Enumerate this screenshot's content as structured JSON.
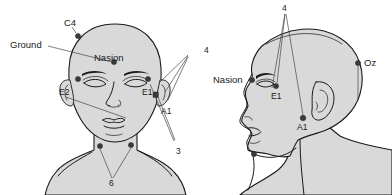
{
  "figure": {
    "views": [
      {
        "name": "frontal-view",
        "label": ""
      },
      {
        "name": "lateral-view",
        "label": ""
      }
    ],
    "colors": {
      "skin_fill": "#d9d9d9",
      "outline": "#1a1a1a",
      "electrode": "#3a3a3a",
      "leader": "#3a3a3a",
      "background": "#ffffff"
    }
  },
  "front_view": {
    "labels": {
      "c4": "C4",
      "ground": "Ground",
      "nasion": "Nasion",
      "e2": "E2",
      "e1": "E1",
      "a1": "A1",
      "four": "4",
      "three": "3",
      "six": "6"
    },
    "electrodes": [
      {
        "id": "C4",
        "name": "electrode-c4",
        "x": 78,
        "y": 36,
        "shape": "dot"
      },
      {
        "id": "Ground",
        "name": "electrode-ground",
        "x": 114,
        "y": 62,
        "shape": "dot"
      },
      {
        "id": "E2",
        "name": "electrode-e2",
        "x": 78,
        "y": 79,
        "shape": "dot"
      },
      {
        "id": "E1",
        "name": "electrode-e1",
        "x": 148,
        "y": 79,
        "shape": "dot"
      },
      {
        "id": "A1",
        "name": "electrode-a1",
        "x": 156,
        "y": 95,
        "shape": "square"
      },
      {
        "id": "N1",
        "name": "electrode-neck-left",
        "x": 100,
        "y": 146,
        "shape": "dot"
      },
      {
        "id": "N2",
        "name": "electrode-neck-right",
        "x": 131,
        "y": 145,
        "shape": "dot"
      }
    ]
  },
  "side_view": {
    "labels": {
      "four": "4",
      "nasion": "Nasion",
      "e1": "E1",
      "a1": "A1",
      "oz": "Oz"
    },
    "electrodes": [
      {
        "id": "Nasion",
        "name": "electrode-nasion-side",
        "x": 252,
        "y": 80,
        "shape": "dot"
      },
      {
        "id": "E1",
        "name": "electrode-e1-side",
        "x": 276,
        "y": 86,
        "shape": "dot"
      },
      {
        "id": "A1",
        "name": "electrode-a1-side",
        "x": 303,
        "y": 118,
        "shape": "dot"
      },
      {
        "id": "Oz",
        "name": "electrode-oz",
        "x": 358,
        "y": 63,
        "shape": "dot"
      },
      {
        "id": "N1",
        "name": "electrode-neck-side",
        "x": 254,
        "y": 154,
        "shape": "dot"
      }
    ]
  }
}
